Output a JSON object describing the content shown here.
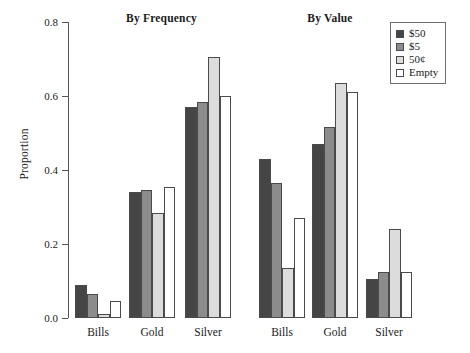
{
  "chart_data": {
    "type": "bar",
    "title": "",
    "xlabel": "",
    "ylabel": "Proportion",
    "ylim": [
      0,
      0.8
    ],
    "yticks": [
      "0.0",
      "0.2",
      "0.4",
      "0.6",
      "0.8"
    ],
    "ytick_values": [
      0.0,
      0.2,
      0.4,
      0.6,
      0.8
    ],
    "grid": false,
    "legend_position": "top-right",
    "categories": [
      "Bills",
      "Gold",
      "Silver"
    ],
    "legend": [
      "$50",
      "$5",
      "50¢",
      "Empty"
    ],
    "panels": [
      {
        "title": "By Frequency",
        "categories": [
          "Bills",
          "Gold",
          "Silver"
        ],
        "series": [
          {
            "name": "$50",
            "values": [
              0.09,
              0.34,
              0.57
            ]
          },
          {
            "name": "$5",
            "values": [
              0.065,
              0.345,
              0.585
            ]
          },
          {
            "name": "50¢",
            "values": [
              0.012,
              0.285,
              0.705
            ]
          },
          {
            "name": "Empty",
            "values": [
              0.045,
              0.355,
              0.6
            ]
          }
        ]
      },
      {
        "title": "By Value",
        "categories": [
          "Bills",
          "Gold",
          "Silver"
        ],
        "series": [
          {
            "name": "$50",
            "values": [
              0.43,
              0.47,
              0.105
            ]
          },
          {
            "name": "$5",
            "values": [
              0.365,
              0.515,
              0.125
            ]
          },
          {
            "name": "50¢",
            "values": [
              0.135,
              0.635,
              0.24
            ]
          },
          {
            "name": "Empty",
            "values": [
              0.27,
              0.61,
              0.125
            ]
          }
        ]
      }
    ],
    "series_colors": [
      "#454545",
      "#8c8c8c",
      "#dcdcdc",
      "#ffffff"
    ],
    "axis_color": "#555555",
    "bar_border_color": "#4a4a4a"
  }
}
